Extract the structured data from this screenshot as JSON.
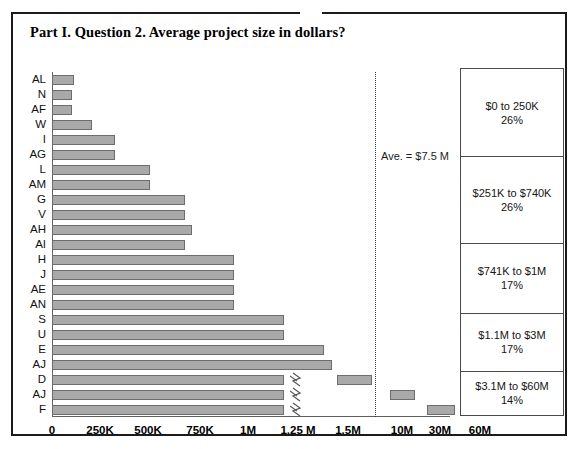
{
  "title": "Part I. Question 2. Average project size in dollars?",
  "chart_data": {
    "type": "bar",
    "orientation": "horizontal",
    "title": "Part I. Question 2. Average project size in dollars?",
    "xlabel": "",
    "ylabel": "",
    "grid": false,
    "axis_break": true,
    "xtick_labels": [
      "0",
      "250K",
      "500K",
      "750K",
      "1M",
      "1.25 M",
      "1.5M",
      "10M",
      "30M",
      "60M"
    ],
    "xtick_values": [
      0,
      250000,
      500000,
      750000,
      1000000,
      1250000,
      1500000,
      10000000,
      30000000,
      60000000
    ],
    "categories": [
      "AL",
      "N",
      "AF",
      "W",
      "I",
      "AG",
      "L",
      "AM",
      "G",
      "V",
      "AH",
      "AI",
      "H",
      "J",
      "AE",
      "AN",
      "S",
      "U",
      "E",
      "AJ",
      "D",
      "AJ",
      "F"
    ],
    "values": [
      60000,
      55000,
      55000,
      115000,
      175000,
      175000,
      300000,
      300000,
      500000,
      500000,
      530000,
      500000,
      750000,
      750000,
      750000,
      750000,
      1080000,
      1080000,
      1400000,
      1450000,
      10000000,
      30000000,
      60000000
    ],
    "broken_bars": [
      "AJ",
      "D",
      "F"
    ],
    "average_value": 7500000,
    "average_label": "Ave. = $7.5 M",
    "legend_title": "",
    "legend_position": "right",
    "distribution": [
      {
        "range": "$0 to 250K",
        "percent": "26%"
      },
      {
        "range": "$251K to $740K",
        "percent": "26%"
      },
      {
        "range": "$741K to $1M",
        "percent": "17%"
      },
      {
        "range": "$1.1M to $3M",
        "percent": "17%"
      },
      {
        "range": "$3.1M to $60M",
        "percent": "14%"
      }
    ]
  },
  "bars": [
    {
      "label": "AL",
      "px": 22,
      "broken": false
    },
    {
      "label": "N",
      "px": 20,
      "broken": false
    },
    {
      "label": "AF",
      "px": 20,
      "broken": false
    },
    {
      "label": "W",
      "px": 40,
      "broken": false
    },
    {
      "label": "I",
      "px": 63,
      "broken": false
    },
    {
      "label": "AG",
      "px": 63,
      "broken": false
    },
    {
      "label": "L",
      "px": 98,
      "broken": false
    },
    {
      "label": "AM",
      "px": 98,
      "broken": false
    },
    {
      "label": "G",
      "px": 133,
      "broken": false
    },
    {
      "label": "V",
      "px": 133,
      "broken": false
    },
    {
      "label": "AH",
      "px": 140,
      "broken": false
    },
    {
      "label": "AI",
      "px": 133,
      "broken": false
    },
    {
      "label": "H",
      "px": 182,
      "broken": false
    },
    {
      "label": "J",
      "px": 182,
      "broken": false
    },
    {
      "label": "AE",
      "px": 182,
      "broken": false
    },
    {
      "label": "AN",
      "px": 182,
      "broken": false
    },
    {
      "label": "S",
      "px": 232,
      "broken": false
    },
    {
      "label": "U",
      "px": 232,
      "broken": false
    },
    {
      "label": "E",
      "px": 272,
      "broken": false
    },
    {
      "label": "AJ",
      "px": 280,
      "broken": false
    },
    {
      "label": "D",
      "px": 232,
      "broken": true,
      "seg_left": 285,
      "seg_width": 35
    },
    {
      "label": "AJ",
      "px": 232,
      "broken": true,
      "seg_left": 338,
      "seg_width": 25
    },
    {
      "label": "F",
      "px": 232,
      "broken": true,
      "seg_left": 375,
      "seg_width": 28
    }
  ],
  "xticks": [
    {
      "label": "0",
      "px": 0
    },
    {
      "label": "250K",
      "px": 48
    },
    {
      "label": "500K",
      "px": 96
    },
    {
      "label": "750K",
      "px": 148
    },
    {
      "label": "1M",
      "px": 196
    },
    {
      "label": "1.25 M",
      "px": 246
    },
    {
      "label": "1.5M",
      "px": 296
    },
    {
      "label": "10M",
      "px": 350
    },
    {
      "label": "30M",
      "px": 388
    },
    {
      "label": "60M",
      "px": 428
    }
  ],
  "average": {
    "label": "Ave. = $7.5 M",
    "px": 323
  }
}
